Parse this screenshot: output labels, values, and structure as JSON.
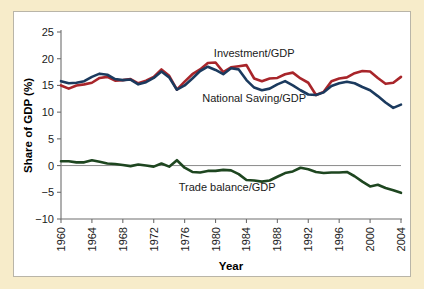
{
  "figure": {
    "background_color": "#f7ecca",
    "panel_color": "#ffffff",
    "border_color": "#b9b5a8"
  },
  "chart_data": {
    "type": "line",
    "title": "",
    "subtitle": "",
    "xlabel": "Year",
    "ylabel": "Share of GDP (%)",
    "xlim": [
      1960,
      2004
    ],
    "ylim": [
      -10,
      25
    ],
    "xticks": [
      1960,
      1964,
      1968,
      1972,
      1976,
      1980,
      1984,
      1988,
      1992,
      1996,
      2000,
      2004
    ],
    "xtick_labels": [
      "1960",
      "1964",
      "1968",
      "1972",
      "1976",
      "1980",
      "1984",
      "1988",
      "1992",
      "1996",
      "2000",
      "2004"
    ],
    "yticks": [
      -10,
      -5,
      0,
      5,
      10,
      15,
      20,
      25
    ],
    "ytick_labels": [
      "−10",
      "−5",
      "0",
      "5",
      "10",
      "15",
      "20",
      "25"
    ],
    "grid": false,
    "legend_position": "inline-annotations",
    "zero_line": true,
    "x": [
      1960,
      1961,
      1962,
      1963,
      1964,
      1965,
      1966,
      1967,
      1968,
      1969,
      1970,
      1971,
      1972,
      1973,
      1974,
      1975,
      1976,
      1977,
      1978,
      1979,
      1980,
      1981,
      1982,
      1983,
      1984,
      1985,
      1986,
      1987,
      1988,
      1989,
      1990,
      1991,
      1992,
      1993,
      1994,
      1995,
      1996,
      1997,
      1998,
      1999,
      2000,
      2001,
      2002,
      2003,
      2004
    ],
    "series": [
      {
        "name": "Investment/GDP",
        "color": "#a8252a",
        "label": "Investment/GDP",
        "label_x": 1985.0,
        "label_y": 20.4,
        "values": [
          15.0,
          14.4,
          15.0,
          15.2,
          15.5,
          16.4,
          16.6,
          15.9,
          16.0,
          16.2,
          15.4,
          15.9,
          16.6,
          18.0,
          16.8,
          14.2,
          15.7,
          17.1,
          18.0,
          19.2,
          19.3,
          17.5,
          18.4,
          18.6,
          18.8,
          16.3,
          15.8,
          16.3,
          16.4,
          17.1,
          17.4,
          16.3,
          15.5,
          13.2,
          13.8,
          15.8,
          16.3,
          16.5,
          17.3,
          17.7,
          17.6,
          16.4,
          15.3,
          15.5,
          16.6
        ]
      },
      {
        "name": "National Saving/GDP",
        "color": "#1b3a5e",
        "label": "National Saving/GDP",
        "label_x": 1985.0,
        "label_y": 11.9,
        "values": [
          15.8,
          15.4,
          15.5,
          15.8,
          16.6,
          17.2,
          17.0,
          16.2,
          16.0,
          16.1,
          15.2,
          15.6,
          16.4,
          17.6,
          16.5,
          14.2,
          15.0,
          16.3,
          17.7,
          18.5,
          17.9,
          17.1,
          18.2,
          18.0,
          16.0,
          14.6,
          14.1,
          14.4,
          15.2,
          15.8,
          15.0,
          14.1,
          13.3,
          13.2,
          13.7,
          14.9,
          15.4,
          15.7,
          15.4,
          14.7,
          14.1,
          13.0,
          11.8,
          10.8,
          11.4
        ]
      },
      {
        "name": "Trade balance/GDP",
        "color": "#1e4620",
        "label": "Trade balance/GDP",
        "label_x": 1981.5,
        "label_y": -4.8,
        "values": [
          0.8,
          0.8,
          0.6,
          0.6,
          1.0,
          0.7,
          0.4,
          0.3,
          0.1,
          -0.1,
          0.2,
          0.0,
          -0.2,
          0.4,
          -0.2,
          1.0,
          -0.4,
          -1.2,
          -1.3,
          -1.0,
          -1.0,
          -0.8,
          -0.9,
          -1.6,
          -2.7,
          -2.8,
          -3.0,
          -2.8,
          -2.1,
          -1.4,
          -1.1,
          -0.4,
          -0.7,
          -1.2,
          -1.4,
          -1.3,
          -1.3,
          -1.2,
          -2.0,
          -3.0,
          -3.9,
          -3.6,
          -4.2,
          -4.6,
          -5.1
        ]
      }
    ]
  }
}
